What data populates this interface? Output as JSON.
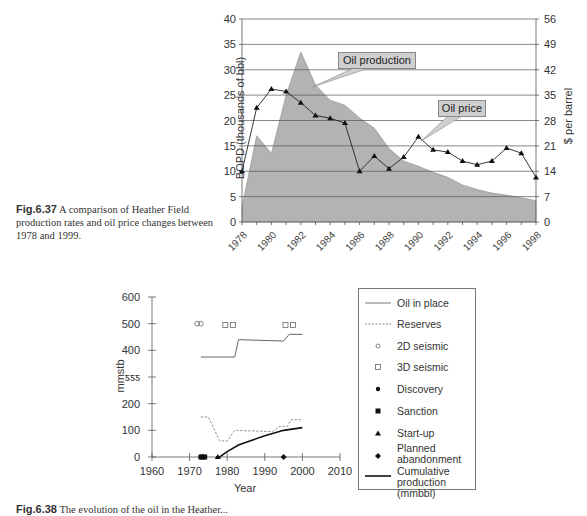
{
  "figure_637": {
    "caption_label": "Fig.6.37",
    "caption_text_1": " A comparison of Heather Field",
    "caption_text_2": "production rates and oil price changes between",
    "caption_text_3": "1978 and 1999."
  },
  "figure_638": {
    "caption_label": "Fig.6.38",
    "caption_text": " The evolution of the oil in the Heather..."
  },
  "chart_data": [
    {
      "type": "area+line",
      "title": "",
      "xlabel": "",
      "ylabel": "BOPD (thousands of bbl)",
      "ylabel_right": "$ per barrel",
      "ylim": [
        0,
        40
      ],
      "ylim_right": [
        0,
        56
      ],
      "yticks": [
        0,
        5,
        10,
        15,
        20,
        25,
        30,
        35,
        40
      ],
      "yticks_right": [
        0,
        7,
        14,
        21,
        28,
        35,
        42,
        49,
        56
      ],
      "grid": true,
      "categories": [
        1978,
        1979,
        1980,
        1981,
        1982,
        1983,
        1984,
        1985,
        1986,
        1987,
        1988,
        1989,
        1990,
        1991,
        1992,
        1993,
        1994,
        1995,
        1996,
        1997,
        1998
      ],
      "xtick_labels": [
        "1978",
        "1980",
        "1982",
        "1984",
        "1986",
        "1988",
        "1990",
        "1992",
        "1994",
        "1996",
        "1998"
      ],
      "series": [
        {
          "name": "Oil production",
          "type": "area",
          "axis": "left",
          "color": "#b3b3b3",
          "values": [
            3,
            17,
            13.5,
            25,
            33.5,
            27,
            24,
            23,
            20.5,
            18.5,
            14.5,
            12,
            11,
            9.8,
            8.8,
            7.3,
            6.4,
            5.7,
            5.3,
            4.8,
            4.2
          ]
        },
        {
          "name": "Oil price",
          "type": "line",
          "axis": "right",
          "marker": "triangle",
          "color": "#222222",
          "values": [
            14,
            31.5,
            36.7,
            36,
            32.9,
            29.4,
            28.6,
            27.3,
            14,
            18.2,
            14.7,
            17.9,
            23.5,
            19.9,
            19.3,
            16.8,
            15.8,
            16.8,
            20.4,
            19,
            12.3
          ]
        }
      ],
      "annotations": [
        {
          "text": "Oil production",
          "points_to": "production area near 1983"
        },
        {
          "text": "Oil price",
          "points_to": "price line near 1990"
        }
      ]
    },
    {
      "type": "line",
      "title": "",
      "xlabel": "Year",
      "ylabel": "mmstb",
      "xlim": [
        1960,
        2010
      ],
      "ylim": [
        0,
        600
      ],
      "xticks": [
        1960,
        1970,
        1980,
        1990,
        2000,
        2010
      ],
      "yticks": [
        0,
        100,
        200,
        300,
        400,
        500,
        600
      ],
      "ytick_labels": [
        "0",
        "100",
        "200",
        "ƽƽƽ",
        "400",
        "500",
        "600"
      ],
      "grid": false,
      "legend_position": "right",
      "series": [
        {
          "name": "Oil in place",
          "style": "solid-thin",
          "points": [
            [
              1973,
              375
            ],
            [
              1982,
              375
            ],
            [
              1983,
              440
            ],
            [
              1995,
              435
            ],
            [
              1996.5,
              460
            ],
            [
              2000,
              460
            ]
          ]
        },
        {
          "name": "Reserves",
          "style": "dashed",
          "points": [
            [
              1973,
              150
            ],
            [
              1975,
              150
            ],
            [
              1978,
              60
            ],
            [
              1980,
              60
            ],
            [
              1982,
              100
            ],
            [
              1992,
              95
            ],
            [
              1994,
              115
            ],
            [
              1996,
              115
            ],
            [
              1997,
              140
            ],
            [
              2000,
              140
            ]
          ]
        },
        {
          "name": "2D seismic",
          "marker": "circle-open",
          "points": [
            [
              1972,
              500
            ],
            [
              1973,
              500
            ]
          ]
        },
        {
          "name": "3D seismic",
          "marker": "square-open",
          "points": [
            [
              1979.5,
              495
            ],
            [
              1981.5,
              495
            ],
            [
              1995.5,
              495
            ],
            [
              1997.5,
              495
            ]
          ]
        },
        {
          "name": "Discovery",
          "marker": "circle-filled",
          "points": [
            [
              1973,
              0
            ]
          ]
        },
        {
          "name": "Sanction",
          "marker": "square-filled",
          "points": [
            [
              1973,
              0
            ],
            [
              1973.5,
              0
            ],
            [
              1974,
              0
            ]
          ]
        },
        {
          "name": "Start-up",
          "marker": "triangle-filled",
          "points": [
            [
              1977.5,
              0
            ]
          ]
        },
        {
          "name": "Planned abandonment",
          "marker": "diamond-filled",
          "points": [
            [
              1995,
              0
            ]
          ]
        },
        {
          "name": "Cumulative production (mmbbl)",
          "style": "solid-thick",
          "points": [
            [
              1977,
              0
            ],
            [
              1978,
              0
            ],
            [
              1980,
              20
            ],
            [
              1983,
              45
            ],
            [
              1986,
              60
            ],
            [
              1990,
              80
            ],
            [
              1995,
              100
            ],
            [
              2000,
              110
            ]
          ]
        }
      ]
    }
  ],
  "legend": {
    "items": [
      {
        "label": "Oil in place",
        "symbol": "line-solid"
      },
      {
        "label": "Reserves",
        "symbol": "line-dashed"
      },
      {
        "label": "2D seismic",
        "symbol": "circle-open"
      },
      {
        "label": "3D seismic",
        "symbol": "square-open"
      },
      {
        "label": "Discovery",
        "symbol": "circle-filled"
      },
      {
        "label": "Sanction",
        "symbol": "square-filled"
      },
      {
        "label": "Start-up",
        "symbol": "triangle-filled"
      },
      {
        "label_1": "Planned",
        "label_2": "abandonment",
        "symbol": "diamond-filled"
      },
      {
        "label_1": "Cumulative",
        "label_2": "production (mmbbl)",
        "symbol": "line-thick"
      }
    ]
  }
}
